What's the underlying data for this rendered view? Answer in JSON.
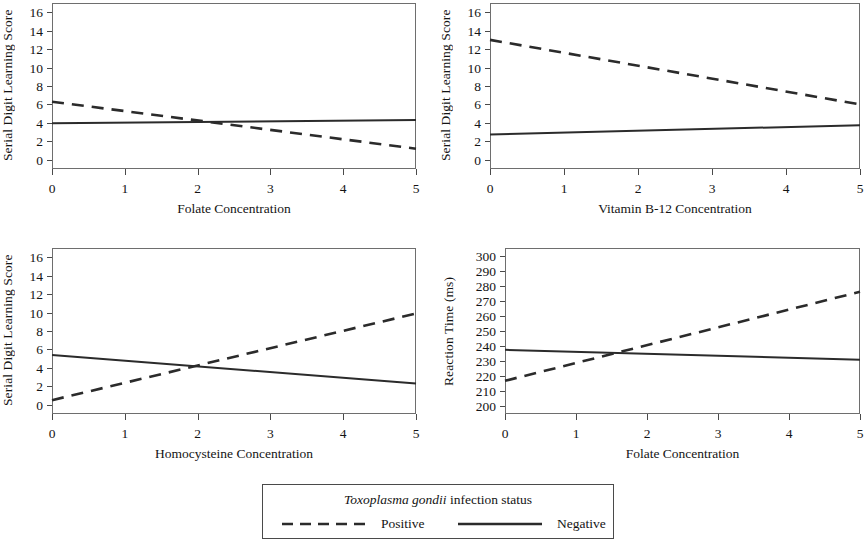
{
  "figure": {
    "background": "#ffffff",
    "line_color": "#2b2b2b",
    "axis_color": "#6e6e6e"
  },
  "legend": {
    "title_italic": "Toxoplasma gondii",
    "title_rest": " infection status",
    "entries": [
      {
        "label": "Positive",
        "style": "dashed"
      },
      {
        "label": "Negative",
        "style": "solid"
      }
    ]
  },
  "chart_data": [
    {
      "type": "line",
      "title": "",
      "xlabel": "Folate Concentration",
      "ylabel": "Serial Digit Learning Score",
      "xlim": [
        0,
        5
      ],
      "ylim": [
        -1,
        17
      ],
      "xticks": [
        "0",
        "1",
        "2",
        "3",
        "4",
        "5"
      ],
      "xtickvals": [
        0,
        1,
        2,
        3,
        4,
        5
      ],
      "yticks": [
        "0",
        "2",
        "4",
        "6",
        "8",
        "10",
        "12",
        "14",
        "16"
      ],
      "ytickvals": [
        0,
        2,
        4,
        6,
        8,
        10,
        12,
        14,
        16
      ],
      "grid": false,
      "series": [
        {
          "name": "Positive",
          "style": "dashed",
          "x": [
            0,
            5
          ],
          "values": [
            6.3,
            1.2
          ]
        },
        {
          "name": "Negative",
          "style": "solid",
          "x": [
            0,
            5
          ],
          "values": [
            3.95,
            4.3
          ]
        }
      ]
    },
    {
      "type": "line",
      "title": "",
      "xlabel": "Vitamin B-12 Concentration",
      "ylabel": "Serial Digit Learning Score",
      "xlim": [
        0,
        5
      ],
      "ylim": [
        -1,
        17
      ],
      "xticks": [
        "0",
        "1",
        "2",
        "3",
        "4",
        "5"
      ],
      "xtickvals": [
        0,
        1,
        2,
        3,
        4,
        5
      ],
      "yticks": [
        "0",
        "2",
        "4",
        "6",
        "8",
        "10",
        "12",
        "14",
        "16"
      ],
      "ytickvals": [
        0,
        2,
        4,
        6,
        8,
        10,
        12,
        14,
        16
      ],
      "grid": false,
      "series": [
        {
          "name": "Positive",
          "style": "dashed",
          "x": [
            0,
            5
          ],
          "values": [
            13.0,
            6.0
          ]
        },
        {
          "name": "Negative",
          "style": "solid",
          "x": [
            0,
            5
          ],
          "values": [
            2.75,
            3.75
          ]
        }
      ]
    },
    {
      "type": "line",
      "title": "",
      "xlabel": "Homocysteine Concentration",
      "ylabel": "Serial Digit Learning Score",
      "xlim": [
        0,
        5
      ],
      "ylim": [
        -1,
        17
      ],
      "xticks": [
        "0",
        "1",
        "2",
        "3",
        "4",
        "5"
      ],
      "xtickvals": [
        0,
        1,
        2,
        3,
        4,
        5
      ],
      "yticks": [
        "0",
        "2",
        "4",
        "6",
        "8",
        "10",
        "12",
        "14",
        "16"
      ],
      "ytickvals": [
        0,
        2,
        4,
        6,
        8,
        10,
        12,
        14,
        16
      ],
      "grid": false,
      "series": [
        {
          "name": "Positive",
          "style": "dashed",
          "x": [
            0,
            5
          ],
          "values": [
            0.5,
            9.9
          ]
        },
        {
          "name": "Negative",
          "style": "solid",
          "x": [
            0,
            5
          ],
          "values": [
            5.4,
            2.3
          ]
        }
      ]
    },
    {
      "type": "line",
      "title": "",
      "xlabel": "Folate Concentration",
      "ylabel": "Reaction Time (ms)",
      "xlim": [
        0,
        5
      ],
      "ylim": [
        195,
        305
      ],
      "xticks": [
        "0",
        "1",
        "2",
        "3",
        "4",
        "5"
      ],
      "xtickvals": [
        0,
        1,
        2,
        3,
        4,
        5
      ],
      "yticks": [
        "200",
        "210",
        "220",
        "230",
        "240",
        "250",
        "260",
        "270",
        "280",
        "290",
        "300"
      ],
      "ytickvals": [
        200,
        210,
        220,
        230,
        240,
        250,
        260,
        270,
        280,
        290,
        300
      ],
      "grid": false,
      "series": [
        {
          "name": "Positive",
          "style": "dashed",
          "x": [
            0,
            5
          ],
          "values": [
            217,
            276
          ]
        },
        {
          "name": "Negative",
          "style": "solid",
          "x": [
            0,
            5
          ],
          "values": [
            237.5,
            231
          ]
        }
      ]
    }
  ]
}
